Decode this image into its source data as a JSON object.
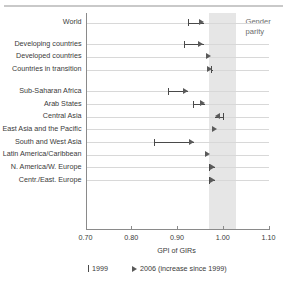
{
  "chart_data": {
    "type": "scatter",
    "title": "",
    "xlabel": "GPI of GIRs",
    "ylabel": "",
    "xlim": [
      0.7,
      1.1
    ],
    "xticks": [
      "0.70",
      "0.80",
      "0.90",
      "1.00",
      "1.10"
    ],
    "xtick_values": [
      0.7,
      0.8,
      0.9,
      1.0,
      1.1
    ],
    "grid": true,
    "legend_position": "bottom",
    "categories": [
      "World",
      "Developing countries",
      "Developed countries",
      "Countries in transition",
      "Sub-Saharan Africa",
      "Arab States",
      "Central Asia",
      "East Asia and the Pacific",
      "South and West Asia",
      "Latin America/Caribbean",
      "N. America/W. Europe",
      "Centr./East. Europe"
    ],
    "series": [
      {
        "name": "1999",
        "values": [
          0.925,
          0.915,
          null,
          0.975,
          0.88,
          0.935,
          1.0,
          null,
          0.85,
          null,
          0.97,
          0.97
        ]
      },
      {
        "name": "2006 (increase since 1999)",
        "values": [
          0.96,
          0.958,
          0.975,
          0.978,
          0.925,
          0.962,
          0.982,
          0.988,
          0.938,
          0.972,
          0.983,
          0.983
        ]
      }
    ],
    "annotation_band": {
      "label": "Gender parity",
      "range": [
        0.97,
        1.03
      ],
      "color": "#e6e6e6"
    },
    "row_gaps_after": [
      0,
      3
    ],
    "legend": [
      {
        "marker": "tick",
        "label": "1999"
      },
      {
        "marker": "triangle-right",
        "label": "2006 (increase since 1999)"
      }
    ]
  },
  "colors": {
    "marker": "#5a5a5a",
    "tick": "#4a4a4a",
    "axis": "#8a8a8a",
    "grid": "#d8d8d8",
    "band": "#e6e6e6",
    "text": "#3a3a3a",
    "band_text": "#6b6b6b",
    "background": "#ffffff"
  }
}
